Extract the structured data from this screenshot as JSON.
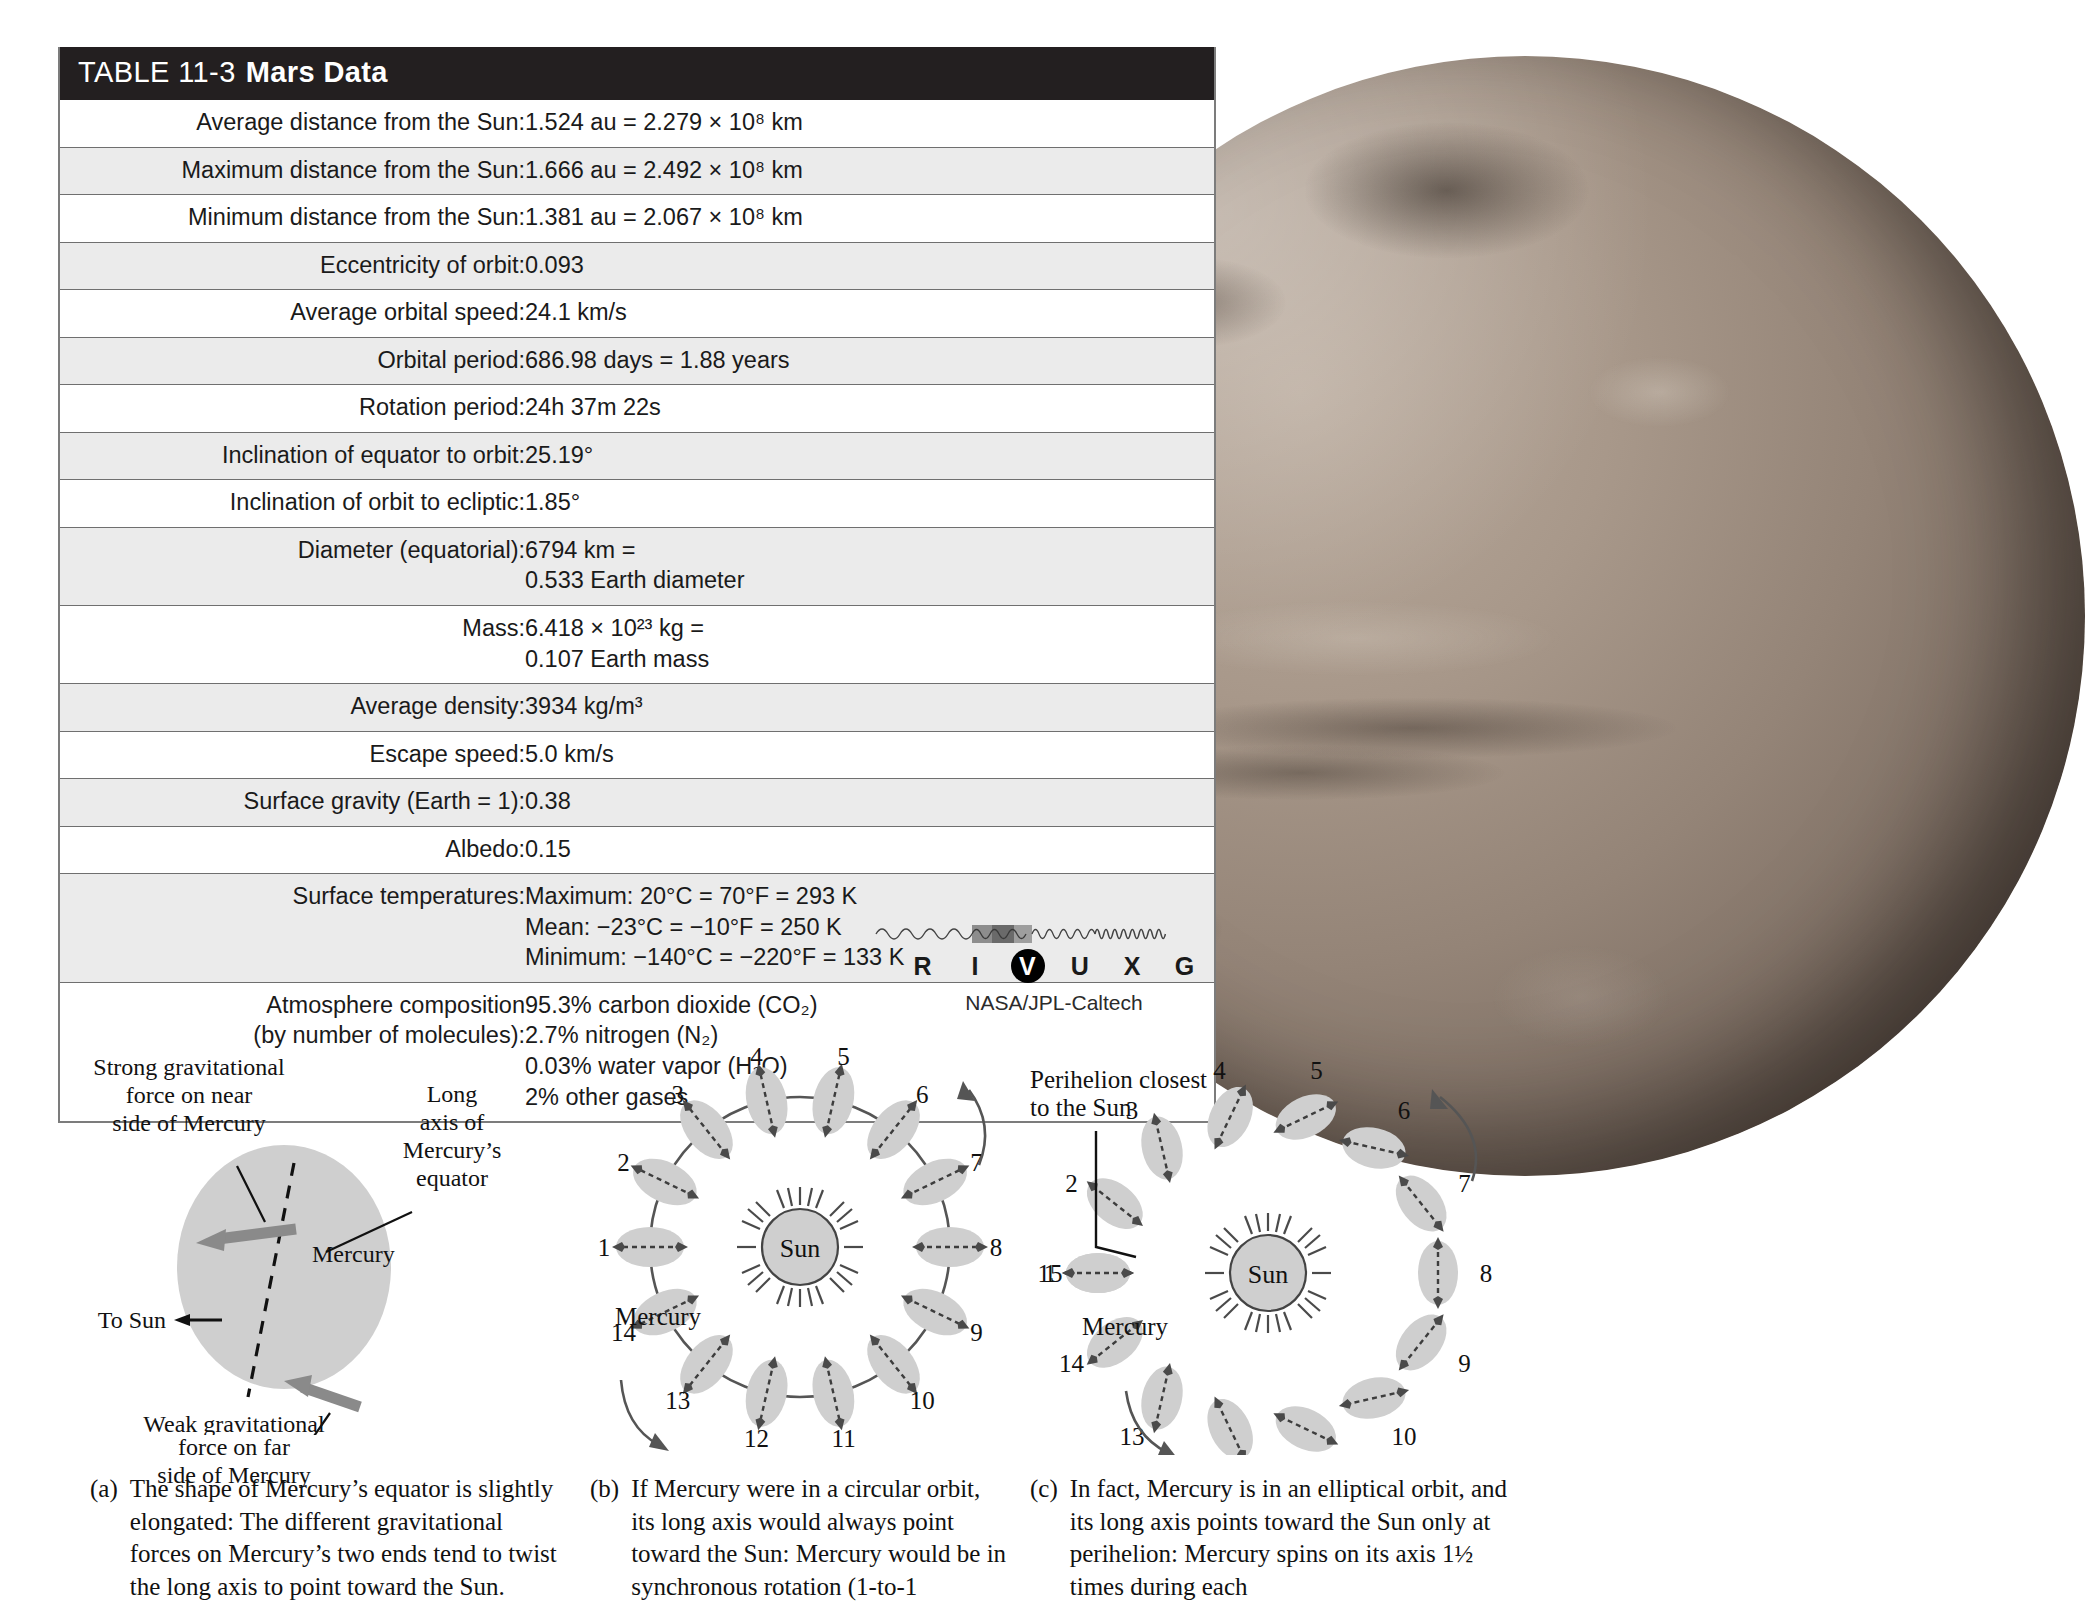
{
  "table": {
    "number_label": "TABLE 11-3",
    "title": "Mars Data",
    "rows": [
      {
        "label": "Average distance from the Sun:",
        "value": "1.524 au = 2.279 × 10⁸ km",
        "shaded": false
      },
      {
        "label": "Maximum distance from the Sun:",
        "value": "1.666 au = 2.492 × 10⁸ km",
        "shaded": true
      },
      {
        "label": "Minimum distance from the Sun:",
        "value": "1.381 au = 2.067 × 10⁸ km",
        "shaded": false
      },
      {
        "label": "Eccentricity of orbit:",
        "value": "0.093",
        "shaded": true
      },
      {
        "label": "Average orbital speed:",
        "value": "24.1 km/s",
        "shaded": false
      },
      {
        "label": "Orbital period:",
        "value": "686.98 days = 1.88 years",
        "shaded": true
      },
      {
        "label": "Rotation period:",
        "value": "24h 37m 22s",
        "shaded": false
      },
      {
        "label": "Inclination of equator to orbit:",
        "value": "25.19°",
        "shaded": true
      },
      {
        "label": "Inclination of orbit to ecliptic:",
        "value": "1.85°",
        "shaded": false
      },
      {
        "label": "Diameter (equatorial):",
        "value": "6794 km =\n0.533 Earth diameter",
        "shaded": true
      },
      {
        "label": "Mass:",
        "value": "6.418 × 10²³ kg =\n0.107 Earth mass",
        "shaded": false
      },
      {
        "label": "Average density:",
        "value": "3934 kg/m³",
        "shaded": true
      },
      {
        "label": "Escape speed:",
        "value": "5.0 km/s",
        "shaded": false
      },
      {
        "label": "Surface gravity (Earth = 1):",
        "value": "0.38",
        "shaded": true
      },
      {
        "label": "Albedo:",
        "value": "0.15",
        "shaded": false
      },
      {
        "label": "Surface temperatures:",
        "value": "Maximum: 20°C = 70°F = 293 K\nMean: −23°C = −10°F = 250 K\nMinimum: −140°C = −220°F = 133 K",
        "shaded": true
      },
      {
        "label": "Atmosphere composition\n(by number of molecules):",
        "value": "95.3% carbon dioxide (CO₂)\n2.7% nitrogen (N₂)\n0.03% water vapor (H₂O)\n2% other gases",
        "shaded": false
      }
    ]
  },
  "wavelength_key": {
    "letters": [
      "R",
      "I",
      "V",
      "U",
      "X",
      "G"
    ],
    "highlighted": "V",
    "credit": "NASA/JPL-Caltech"
  },
  "figure_a": {
    "labels": {
      "strong_force": "Strong gravitational\nforce on near\nside of Mercury",
      "long_axis": "Long\naxis of\nMercury’s\nequator",
      "planet": "Mercury",
      "to_sun": "To Sun",
      "weak_force": "Weak gravitational\nforce on far\nside of Mercury"
    }
  },
  "figure_b": {
    "sun_label": "Sun",
    "planet_label": "Mercury",
    "positions": [
      "1",
      "2",
      "3",
      "4",
      "5",
      "6",
      "7",
      "8",
      "9",
      "10",
      "11",
      "12",
      "13",
      "14"
    ]
  },
  "figure_c": {
    "sun_label": "Sun",
    "planet_label": "Mercury",
    "perihelion_label": "Perihelion closest\nto the Sun",
    "positions": [
      "1",
      "2",
      "3",
      "4",
      "5",
      "6",
      "7",
      "8",
      "9",
      "10",
      "11",
      "12",
      "13",
      "14",
      "15"
    ]
  },
  "captions": {
    "a": {
      "key": "(a)",
      "text": "The shape of Mercury’s equator is slightly elongated: The different gravitational forces on Mercury’s two ends tend to twist the long axis to point toward the Sun."
    },
    "b": {
      "key": "(b)",
      "text": "If Mercury were in a circular orbit, its long axis would always point toward the Sun: Mercury would be in synchronous rotation (1-to-1"
    },
    "c": {
      "key": "(c)",
      "text": "In fact, Mercury is in an elliptical orbit, and its long axis points toward the Sun only at perihelion: Mercury spins on its axis 1½ times during each"
    }
  },
  "colors": {
    "header_bg": "#231f20",
    "row_shaded": "#ebebeb",
    "row_plain": "#ffffff",
    "rule": "#6f6f6f",
    "planet_fill": "#cfcfcf",
    "arrow_gray": "#8a8a8a"
  }
}
